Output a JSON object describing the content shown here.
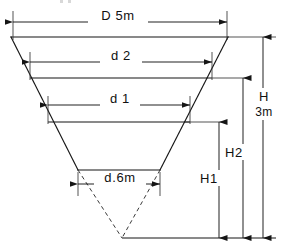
{
  "diagram": {
    "type": "engineering-dimension-drawing",
    "units": "m",
    "line_color": "#151515",
    "dash_color": "#3a3a3a",
    "background": "#ffffff"
  },
  "labels": {
    "top_width": "D 5m",
    "water_level_2": "d 2",
    "water_level_1": "d 1",
    "bottom_width": "d.6m",
    "total_depth": "H",
    "total_depth_value": "3m",
    "depth_2": "H2",
    "depth_1": "H1"
  },
  "dimensions": {
    "horizontal": [
      {
        "name": "top-width",
        "label": "D 5m",
        "value": 5,
        "unit": "m",
        "y": 22
      },
      {
        "name": "water-level-2-width",
        "label": "d 2",
        "value": null,
        "unit": "m",
        "y": 62
      },
      {
        "name": "water-level-1-width",
        "label": "d 1",
        "value": null,
        "unit": "m",
        "y": 105
      },
      {
        "name": "bottom-width",
        "label": "d.6m",
        "value": 0.6,
        "unit": "m",
        "y": 184
      }
    ],
    "vertical": [
      {
        "name": "depth-1",
        "label": "H1",
        "x": 219,
        "from_y": 122,
        "to_y": 238
      },
      {
        "name": "depth-2",
        "label": "H2",
        "x": 243,
        "from_y": 78,
        "to_y": 238
      },
      {
        "name": "total-depth",
        "label": "H",
        "value": "3m",
        "x": 263,
        "from_y": 37,
        "to_y": 238
      }
    ]
  },
  "geometry": {
    "top_edge": {
      "x1": 11,
      "y1": 37,
      "x2": 228,
      "y2": 37
    },
    "level_2_edge": {
      "x1": 30,
      "y1": 78,
      "x2": 212,
      "y2": 78
    },
    "level_1_edge": {
      "x1": 48,
      "y1": 122,
      "x2": 190,
      "y2": 122
    },
    "bottom_edge": {
      "x1": 78,
      "y1": 170,
      "x2": 160,
      "y2": 170
    },
    "apex": {
      "x": 122,
      "y": 238
    },
    "datum_line": {
      "x1": 122,
      "y1": 238,
      "x2": 276,
      "y2": 238
    }
  }
}
